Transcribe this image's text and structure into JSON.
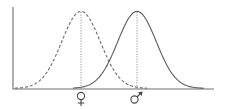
{
  "chart_data": {
    "type": "line",
    "title": "",
    "xlabel": "",
    "ylabel": "",
    "grid": false,
    "legend": "none",
    "series": [
      {
        "name": "female",
        "symbol": "♀",
        "line_style": "dashed",
        "mean_px": 81,
        "sigma_px": 19.3,
        "x_range_px": [
          15,
          147
        ]
      },
      {
        "name": "male",
        "symbol": "♂",
        "line_style": "solid",
        "mean_px": 137,
        "sigma_px": 19.3,
        "x_range_px": [
          73,
          204
        ]
      }
    ],
    "axes": {
      "origin_px": [
        13,
        89
      ],
      "y_top_px": 7,
      "x_end_px": 214,
      "peak_y_px": 12
    },
    "tick_labels": [
      "♀",
      "♂"
    ]
  },
  "labels": {
    "female_symbol": "♀",
    "male_symbol": "♂"
  },
  "colors": {
    "line": "#5a5a5a",
    "axis": "#6e6e6e",
    "background": "#ffffff"
  }
}
